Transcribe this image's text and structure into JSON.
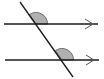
{
  "diagram": {
    "type": "parallel-lines-transversal",
    "background": "#ffffff",
    "stroke_color": "#1a1a1a",
    "arrow_color": "#555555",
    "angle_fill": "#b0b0b0",
    "angle_stroke": "#555555",
    "lines": [
      {
        "name": "upper-parallel-line",
        "y": 24,
        "x1": 4,
        "x2": 98,
        "arrow": "right"
      },
      {
        "name": "lower-parallel-line",
        "y": 60,
        "x1": 5,
        "x2": 99,
        "arrow": "right"
      }
    ],
    "transversal": {
      "x1": 20,
      "y1": 2,
      "x2": 73,
      "y2": 77
    },
    "marked_angles": [
      {
        "name": "upper-angle",
        "vertex": [
          36,
          24
        ],
        "position": "upper-right of transversal, above line"
      },
      {
        "name": "lower-angle",
        "vertex": [
          62,
          60
        ],
        "position": "upper-right of transversal, above line"
      }
    ]
  }
}
